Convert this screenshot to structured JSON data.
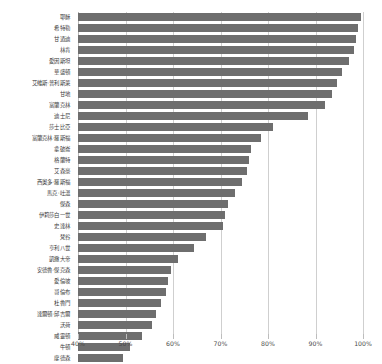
{
  "chart_data": {
    "type": "bar",
    "orientation": "horizontal",
    "title": "",
    "subtitle": "",
    "xlabel": "",
    "ylabel": "",
    "xlim": [
      40,
      100
    ],
    "xticks": [
      40,
      50,
      60,
      70,
      80,
      90,
      100
    ],
    "xticklabels": [
      "40%",
      "50%",
      "60%",
      "70%",
      "80%",
      "90%",
      "100%"
    ],
    "grid": true,
    "legend": false,
    "bar_color": "#6e6e6e",
    "grid_color": "#cfcfcf",
    "categories": [
      "耶穌",
      "希特勒",
      "甘迺迪",
      "林肯",
      "愛因斯坦",
      "華盛頓",
      "艾維斯‧普利斯萊",
      "甘地",
      "富蘭克林",
      "迪士尼",
      "莎士比亞",
      "富蘭克林‧羅斯福",
      "拿破崙",
      "格蘭特",
      "艾森豪",
      "西奧多‧羅斯福",
      "馬克‧吐溫",
      "傑森",
      "伊莉莎白一世",
      "史達林",
      "梵谷",
      "亨利八世",
      "凱撒大帝",
      "安德魯‧傑克森",
      "愛倫坡",
      "哥倫布",
      "杜魯門",
      "達爾頓‧邱吉爾",
      "沃荷",
      "威靈頓",
      "牛頓",
      "摩德森"
    ],
    "values": [
      99.5,
      99.0,
      98.5,
      98.0,
      97.0,
      95.5,
      94.5,
      93.5,
      92.0,
      88.5,
      81.0,
      78.5,
      76.5,
      76.0,
      75.5,
      74.5,
      73.0,
      71.5,
      71.0,
      70.5,
      67.0,
      64.5,
      61.0,
      59.5,
      59.0,
      58.5,
      57.5,
      56.5,
      55.5,
      53.5,
      51.0,
      49.5
    ]
  }
}
